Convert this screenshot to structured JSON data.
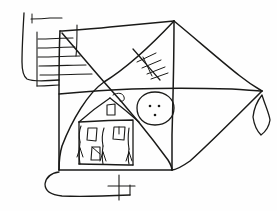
{
  "artwork": {
    "title": "Hand-drawn pencil sketch",
    "medium": "graphite line drawing on white paper",
    "subject": "house with figures inside a kite-shaped enclosure",
    "canvas": {
      "width": 277,
      "height": 211,
      "background": "#fefefe"
    },
    "ink_color": "#1a1a18"
  },
  "elements": {
    "outer_quad": {
      "name": "kite-shaped outer outline",
      "points": "104,29 175,21 262,91 172,170 60,170 60,100 104,29"
    },
    "left_flap": {
      "name": "rounded tab on left edge",
      "notch_label": "small tick on upper tab edge"
    },
    "bottom_flap": {
      "name": "rounded tab under lower edge"
    },
    "diagonals": {
      "name": "crossing diagonals forming X",
      "center": "104,82"
    },
    "horizontal_band": {
      "name": "horizontal divider line across middle"
    },
    "hatch_ladder": {
      "name": "stack of horizontal hatch lines upper-left",
      "line_count": 6
    },
    "tick_diagonal": {
      "name": "diagonal line with cross ticks",
      "tick_count": 5
    },
    "house": {
      "name": "house with gabled roof",
      "chimney": "small chimney on roof ridge",
      "windows": 3,
      "figures": 3,
      "figure_note": "stick figures standing inside the house"
    },
    "face_circle": {
      "name": "circle with face (two eyes and mouth dot)",
      "cx": 155,
      "cy": 108,
      "rx": 18,
      "ry": 16
    },
    "right_diamond": {
      "name": "diamond shape hanging at right vertex"
    },
    "bottom_cross": {
      "name": "small plus mark below bottom edge"
    }
  }
}
